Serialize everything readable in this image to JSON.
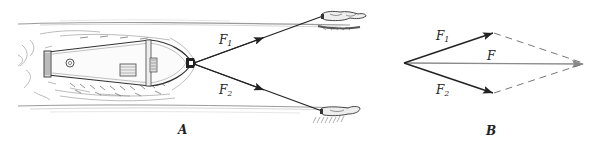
{
  "figure": {
    "panel_a": {
      "caption": "A",
      "force_labels": [
        {
          "symbol": "F",
          "subscript": "1"
        },
        {
          "symbol": "F",
          "subscript": "2"
        }
      ],
      "objects": [
        "barge",
        "tow-animal-upper",
        "tow-animal-lower",
        "tow-rope-1",
        "tow-rope-2"
      ]
    },
    "panel_b": {
      "caption": "B",
      "resultant_label": "F",
      "force_labels": [
        {
          "symbol": "F",
          "subscript": "1"
        },
        {
          "symbol": "F",
          "subscript": "2"
        }
      ],
      "construction": "parallelogram"
    },
    "colors": {
      "ink": "#222222",
      "resultant": "#8a8a8a",
      "dashed": "#777777",
      "hatch": "#9a9a9a",
      "background": "#ffffff"
    }
  }
}
